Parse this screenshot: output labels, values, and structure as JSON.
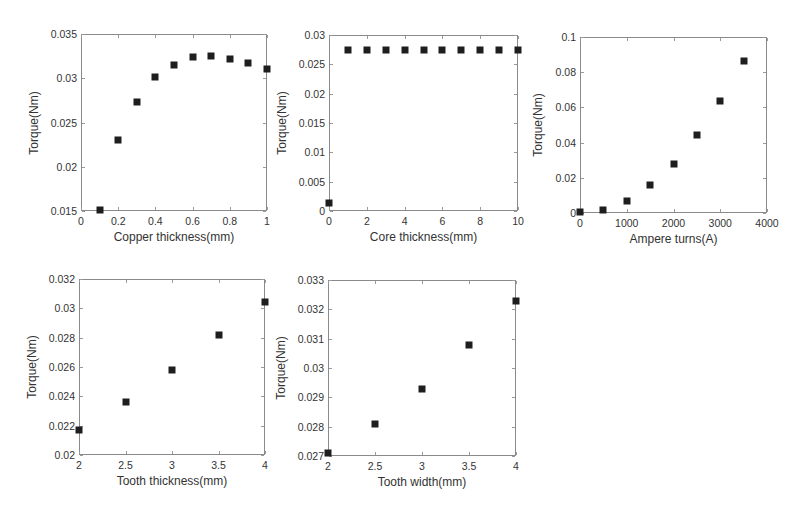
{
  "chart_data": [
    {
      "id": "copper",
      "type": "scatter",
      "title": "",
      "xlabel": "Copper thickness(mm)",
      "ylabel": "Torque(Nm)",
      "xlim": [
        0,
        1
      ],
      "ylim": [
        0.015,
        0.035
      ],
      "xticks": [
        "0",
        "0.2",
        "0.4",
        "0.6",
        "0.8",
        "1"
      ],
      "xtick_values": [
        0,
        0.2,
        0.4,
        0.6,
        0.8,
        1
      ],
      "yticks": [
        "0.015",
        "0.02",
        "0.025",
        "0.03",
        "0.035"
      ],
      "ytick_values": [
        0.015,
        0.02,
        0.025,
        0.03,
        0.035
      ],
      "grid": false,
      "legend": null,
      "marker": "square",
      "x": [
        0.1,
        0.2,
        0.3,
        0.4,
        0.5,
        0.6,
        0.7,
        0.8,
        0.9,
        1.0
      ],
      "y": [
        0.0151,
        0.023,
        0.0273,
        0.0301,
        0.0315,
        0.0324,
        0.0325,
        0.0322,
        0.0317,
        0.0311
      ],
      "frame": {
        "left": 81,
        "top": 34,
        "width": 186,
        "height": 177
      }
    },
    {
      "id": "core",
      "type": "scatter",
      "title": "",
      "xlabel": "Core thickness(mm)",
      "ylabel": "Torque(Nm)",
      "xlim": [
        0,
        10
      ],
      "ylim": [
        0,
        0.03
      ],
      "xticks": [
        "0",
        "2",
        "4",
        "6",
        "8",
        "10"
      ],
      "xtick_values": [
        0,
        2,
        4,
        6,
        8,
        10
      ],
      "yticks": [
        "0",
        "0.005",
        "0.01",
        "0.015",
        "0.02",
        "0.025",
        "0.03"
      ],
      "ytick_values": [
        0,
        0.005,
        0.01,
        0.015,
        0.02,
        0.025,
        0.03
      ],
      "grid": false,
      "legend": null,
      "marker": "square",
      "x": [
        0,
        1,
        2,
        3,
        4,
        5,
        6,
        7,
        8,
        9,
        10
      ],
      "y": [
        0.0014,
        0.0274,
        0.0274,
        0.0274,
        0.0274,
        0.0275,
        0.0275,
        0.0275,
        0.0274,
        0.0274,
        0.0274
      ],
      "frame": {
        "left": 329,
        "top": 35,
        "width": 189,
        "height": 176
      }
    },
    {
      "id": "ampere",
      "type": "scatter",
      "title": "",
      "xlabel": "Ampere turns(A)",
      "ylabel": "Torque(Nm)",
      "xlim": [
        0,
        4000
      ],
      "ylim": [
        0,
        0.1
      ],
      "xticks": [
        "0",
        "1000",
        "2000",
        "3000",
        "4000"
      ],
      "xtick_values": [
        0,
        1000,
        2000,
        3000,
        4000
      ],
      "yticks": [
        "0",
        "0.02",
        "0.04",
        "0.06",
        "0.08",
        "0.1"
      ],
      "ytick_values": [
        0,
        0.02,
        0.04,
        0.06,
        0.08,
        0.1
      ],
      "grid": false,
      "legend": null,
      "marker": "square",
      "x": [
        0,
        500,
        1000,
        1500,
        2000,
        2500,
        3000,
        3500
      ],
      "y": [
        0.0003,
        0.0017,
        0.0071,
        0.0159,
        0.028,
        0.0441,
        0.0637,
        0.0862
      ],
      "frame": {
        "left": 580,
        "top": 37,
        "width": 187,
        "height": 176
      }
    },
    {
      "id": "tooth-thickness",
      "type": "scatter",
      "title": "",
      "xlabel": "Tooth thickness(mm)",
      "ylabel": "Torque(Nm)",
      "xlim": [
        2,
        4
      ],
      "ylim": [
        0.02,
        0.032
      ],
      "xticks": [
        "2",
        "2.5",
        "3",
        "3.5",
        "4"
      ],
      "xtick_values": [
        2,
        2.5,
        3,
        3.5,
        4
      ],
      "yticks": [
        "0.02",
        "0.022",
        "0.024",
        "0.026",
        "0.028",
        "0.03",
        "0.032"
      ],
      "ytick_values": [
        0.02,
        0.022,
        0.024,
        0.026,
        0.028,
        0.03,
        0.032
      ],
      "grid": false,
      "legend": null,
      "marker": "square",
      "x": [
        2,
        2.5,
        3,
        3.5,
        4
      ],
      "y": [
        0.0217,
        0.0236,
        0.0258,
        0.0282,
        0.0304
      ],
      "frame": {
        "left": 79,
        "top": 279,
        "width": 186,
        "height": 176
      }
    },
    {
      "id": "tooth-width",
      "type": "scatter",
      "title": "",
      "xlabel": "Tooth width(mm)",
      "ylabel": "Torque(Nm)",
      "xlim": [
        2,
        4
      ],
      "ylim": [
        0.027,
        0.033
      ],
      "xticks": [
        "2",
        "2.5",
        "3",
        "3.5",
        "4"
      ],
      "xtick_values": [
        2,
        2.5,
        3,
        3.5,
        4
      ],
      "yticks": [
        "0.027",
        "0.028",
        "0.029",
        "0.03",
        "0.031",
        "0.032",
        "0.033"
      ],
      "ytick_values": [
        0.027,
        0.028,
        0.029,
        0.03,
        0.031,
        0.032,
        0.033
      ],
      "grid": false,
      "legend": null,
      "marker": "square",
      "x": [
        2,
        2.5,
        3,
        3.5,
        4
      ],
      "y": [
        0.0271,
        0.0281,
        0.0293,
        0.0308,
        0.0323
      ],
      "frame": {
        "left": 328,
        "top": 280,
        "width": 188,
        "height": 176
      }
    }
  ],
  "figure": {
    "marker_color": "#1e1e1e",
    "axis_color": "#8a8a8a",
    "background": "#ffffff"
  }
}
